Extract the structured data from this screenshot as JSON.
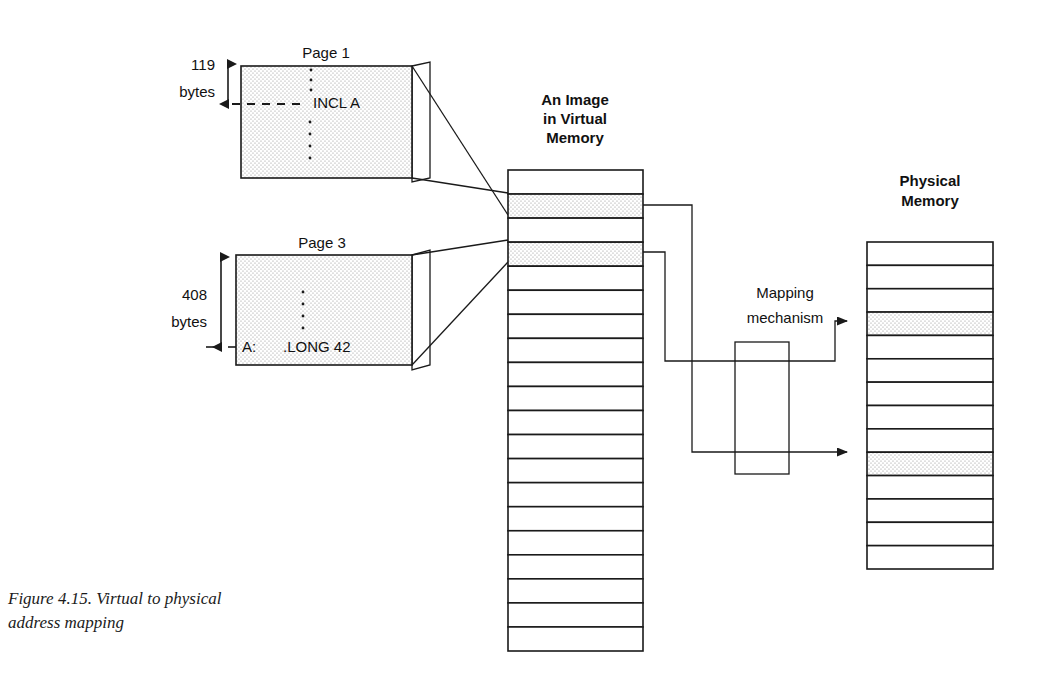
{
  "figure": {
    "caption_line1": "Figure 4.15. Virtual to physical",
    "caption_line2": "address mapping"
  },
  "pages": [
    {
      "title": "Page 1",
      "size_value": "119",
      "size_unit": "bytes",
      "code": "INCL  A",
      "code_label": "",
      "box": {
        "x": 241,
        "y": 66,
        "w": 171,
        "h": 112
      }
    },
    {
      "title": "Page 3",
      "size_value": "408",
      "size_unit": "bytes",
      "code": ".LONG   42",
      "code_label": "A:",
      "box": {
        "x": 236,
        "y": 255,
        "w": 176,
        "h": 110
      }
    }
  ],
  "virtual_memory": {
    "title_line1": "An Image",
    "title_line2": "in Virtual",
    "title_line3": "Memory",
    "rows_total": 20,
    "shaded_rows": [
      2,
      4
    ],
    "geometry": {
      "x": 508,
      "y": 170,
      "w": 135,
      "h": 481
    }
  },
  "physical_memory": {
    "title_line1": "Physical",
    "title_line2": "Memory",
    "rows_total": 14,
    "shaded_rows": [
      4,
      10
    ],
    "geometry": {
      "x": 867,
      "y": 242,
      "w": 126,
      "h": 327
    }
  },
  "mapping": {
    "title_line1": "Mapping",
    "title_line2": "mechanism",
    "box": {
      "x": 735,
      "y": 342,
      "w": 54,
      "h": 132
    }
  },
  "colors": {
    "ink": "#1a1a1a",
    "paper": "#ffffff",
    "stipple": "#9a9a9a"
  }
}
